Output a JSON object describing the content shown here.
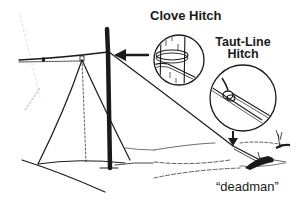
{
  "figure": {
    "labels": {
      "clove_hitch": "Clove Hitch",
      "taut_line_hitch": "Taut-Line Hitch",
      "deadman": "“deadman”"
    },
    "colors": {
      "ink": "#1a1a1a",
      "background": "#ffffff"
    }
  }
}
